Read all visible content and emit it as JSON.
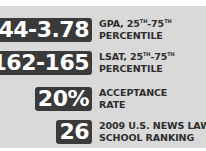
{
  "stats": [
    {
      "value": "3.44-3.78",
      "label_line1": "GPA, 25",
      "sup1": "TH",
      "mid": "-75",
      "sup2": "TH",
      "label_line2": "PERCENTILE"
    },
    {
      "value": "162-165",
      "label_line1": "LSAT, 25",
      "sup1": "TH",
      "mid": "-75",
      "sup2": "TH",
      "label_line2": "PERCENTILE"
    },
    {
      "value": "20%",
      "label_line1": "ACCEPTANCE",
      "label_line2": "RATE"
    },
    {
      "value": "26",
      "label_line1": "2009 U.S. NEWS LAW",
      "label_line2": "SCHOOL RANKING"
    }
  ],
  "colors": {
    "panel_bg": "#d9d9d9",
    "badge_bg": "#3a3a3a",
    "badge_text": "#ffffff",
    "label_text": "#2d2d2d"
  }
}
